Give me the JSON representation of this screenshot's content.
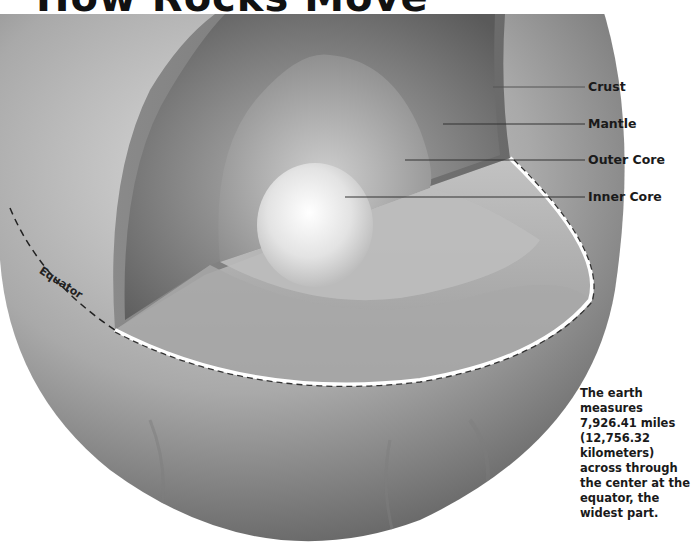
{
  "header": {
    "title": "How Rocks Move"
  },
  "diagram": {
    "layers": [
      {
        "id": "crust",
        "label": "Crust"
      },
      {
        "id": "mantle",
        "label": "Mantle"
      },
      {
        "id": "outer_core",
        "label": "Outer Core"
      },
      {
        "id": "inner_core",
        "label": "Inner Core"
      }
    ],
    "equator_label": "Equator",
    "note": "The earth measures 7,926.41 miles (12,756.32 kilometers) across through the center at the equator, the widest part.",
    "colors": {
      "background": "#ffffff",
      "text": "#1a1a1a",
      "leader_line": "#333333",
      "sphere_light": "#d6d6d6",
      "sphere_dark": "#6e6e6e"
    }
  }
}
